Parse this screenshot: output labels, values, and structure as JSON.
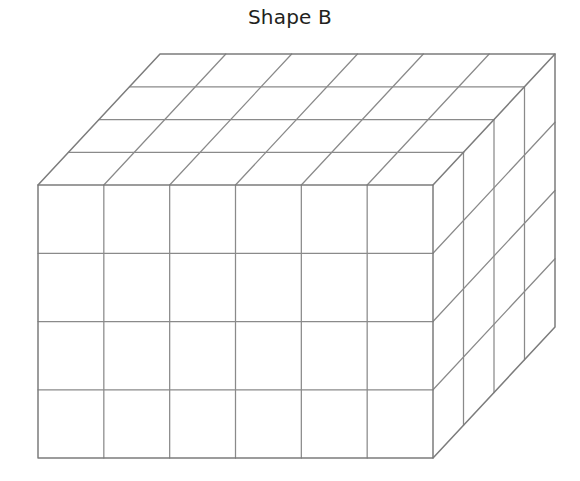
{
  "page": {
    "background_color": "#ffffff",
    "width": 580,
    "height": 481
  },
  "title": {
    "text": "Shape B",
    "color": "#231f20"
  },
  "figure": {
    "name": "rectangular-prism-unit-cube-grid",
    "line_color": "#8a8a8a",
    "fill_color": "#ffffff",
    "dimensions": {
      "width_units": 6,
      "height_units": 4,
      "depth_units": 4,
      "total_unit_cubes": 96
    },
    "geometry": {
      "front_top_left": [
        38,
        185
      ],
      "front_top_right": [
        433,
        185
      ],
      "front_bottom_left": [
        38,
        458
      ],
      "front_bottom_right": [
        433,
        458
      ],
      "depth_offset": [
        122,
        -131
      ]
    },
    "visible_faces": [
      "top",
      "front",
      "right"
    ]
  }
}
